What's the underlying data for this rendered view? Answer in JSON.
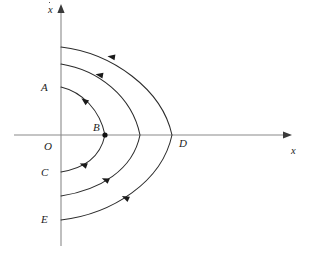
{
  "figure": {
    "kind": "phase-plane-diagram",
    "background_color": "#ffffff",
    "curve_color": "#2b2b2b",
    "axis_color": "#8a8a8a",
    "label_color": "#1c1c1c",
    "width": 309,
    "height": 264
  },
  "axes": {
    "x_axis": {
      "label": "x",
      "label_x": 291,
      "label_y": 146,
      "y_pixel": 135,
      "x_start": 14,
      "x_end": 286,
      "arrow": "right"
    },
    "y_axis": {
      "label": "x",
      "label_accent": "dot",
      "label_x": 48,
      "label_y": 5,
      "x_pixel": 61,
      "y_start": 10,
      "y_end": 246,
      "arrow": "up"
    },
    "origin": {
      "x": 61,
      "y": 135
    }
  },
  "points": [
    {
      "id": "A",
      "label": "A",
      "label_x": 41,
      "label_y": 82,
      "point_x": 61,
      "point_y": 87,
      "dot": false
    },
    {
      "id": "B",
      "label": "B",
      "label_x": 93,
      "label_y": 122,
      "point_x": 105,
      "point_y": 135,
      "dot": true
    },
    {
      "id": "C",
      "label": "C",
      "label_x": 41,
      "label_y": 167,
      "point_x": 61,
      "point_y": 172,
      "dot": false
    },
    {
      "id": "D",
      "label": "D",
      "label_x": 179,
      "label_y": 138,
      "point_x": 172,
      "point_y": 135,
      "dot": false
    },
    {
      "id": "E",
      "label": "E",
      "label_x": 41,
      "label_y": 214,
      "point_x": 61,
      "point_y": 220,
      "dot": false
    },
    {
      "id": "O",
      "label": "O",
      "label_x": 44,
      "label_y": 141,
      "point_x": 61,
      "point_y": 135,
      "dot": false
    }
  ],
  "trajectories": [
    {
      "name": "inner-orbit-A-B-C",
      "start_label": "A",
      "vertex_label": "B",
      "end_label": "C",
      "top_y": 87,
      "vertex_x": 105,
      "bottom_y": 172,
      "path": "M 61 87 C 82 92, 100 110, 105 135 C 100 158, 84 168, 61 172",
      "arrows": [
        {
          "x": 85,
          "y": 101,
          "angle": 218
        },
        {
          "x": 84,
          "y": 165,
          "angle": 200
        }
      ]
    },
    {
      "name": "middle-orbit",
      "start_label": "",
      "vertex_label": "",
      "end_label": "",
      "top_y": 64,
      "vertex_x": 140,
      "bottom_y": 196,
      "path": "M 61 64 C 98 70, 132 96, 140 135 C 133 170, 100 190, 61 196",
      "arrows": [
        {
          "x": 100,
          "y": 75,
          "angle": 190
        },
        {
          "x": 106,
          "y": 180,
          "angle": 203
        }
      ]
    },
    {
      "name": "outer-orbit-through-D-E",
      "start_label": "",
      "vertex_label": "D",
      "end_label": "E",
      "top_y": 47,
      "vertex_x": 172,
      "bottom_y": 220,
      "path": "M 61 47 C 112 53, 162 89, 172 135 C 162 182, 112 214, 61 220",
      "arrows": [
        {
          "x": 112,
          "y": 57,
          "angle": 189
        },
        {
          "x": 126,
          "y": 198,
          "angle": 205
        }
      ]
    }
  ],
  "flow_direction_note": "counterclockwise-to-the-left"
}
